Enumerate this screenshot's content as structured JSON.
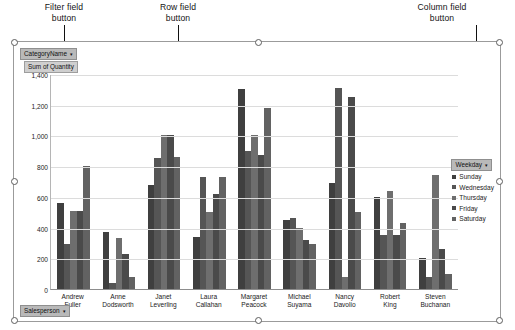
{
  "annotations": [
    {
      "name": "filter-field-callout",
      "text": "Filter field\nbutton"
    },
    {
      "name": "row-field-callout",
      "text": "Row field\nbutton"
    },
    {
      "name": "column-field-callout",
      "text": "Column field\nbutton"
    }
  ],
  "field_buttons": {
    "filter": {
      "label": "CategoryName",
      "arrow": "▾"
    },
    "value": {
      "label": "Sum of Quantity",
      "arrow": ""
    },
    "row": {
      "label": "Salesperson",
      "arrow": "▾"
    },
    "column": {
      "label": "Weekday",
      "arrow": "▾"
    }
  },
  "legend": {
    "position": "right",
    "items": [
      {
        "label": "Sunday",
        "color": "#3f3f3f"
      },
      {
        "label": "Wednesday",
        "color": "#555555"
      },
      {
        "label": "Thursday",
        "color": "#6e6e6e"
      },
      {
        "label": "Friday",
        "color": "#4a4a4a"
      },
      {
        "label": "Saturday",
        "color": "#626262"
      }
    ]
  },
  "chart_data": {
    "type": "bar",
    "title": "",
    "xlabel": "",
    "ylabel": "",
    "ylim": [
      0,
      1400
    ],
    "ytick_labels": [
      "1,400",
      "1,200",
      "1,000",
      "800",
      "600",
      "400",
      "200",
      "0"
    ],
    "yticks": [
      1400,
      1200,
      1000,
      800,
      600,
      400,
      200,
      0
    ],
    "grid": true,
    "value_field": "Sum of Quantity",
    "categories": [
      "Andrew Fuller",
      "Anne Dodsworth",
      "Janet Leverling",
      "Laura Callahan",
      "Margaret Peacock",
      "Michael Suyama",
      "Nancy Davolio",
      "Robert King",
      "Steven Buchanan"
    ],
    "series": [
      {
        "name": "Sunday",
        "color": "#3f3f3f",
        "values": [
          560,
          370,
          680,
          340,
          1300,
          450,
          690,
          600,
          200
        ]
      },
      {
        "name": "Wednesday",
        "color": "#555555",
        "values": [
          290,
          40,
          850,
          730,
          900,
          460,
          1310,
          350,
          80
        ]
      },
      {
        "name": "Thursday",
        "color": "#6e6e6e",
        "values": [
          510,
          330,
          1000,
          500,
          1000,
          400,
          80,
          640,
          740
        ]
      },
      {
        "name": "Friday",
        "color": "#4a4a4a",
        "values": [
          510,
          230,
          1000,
          620,
          870,
          320,
          1250,
          350,
          260
        ]
      },
      {
        "name": "Saturday",
        "color": "#626262",
        "values": [
          800,
          75,
          860,
          730,
          1180,
          290,
          500,
          430,
          100
        ]
      }
    ]
  }
}
